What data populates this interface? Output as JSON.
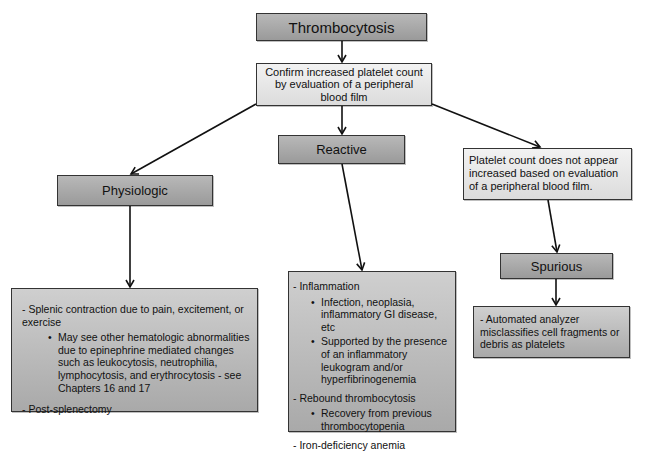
{
  "diagram": {
    "root": {
      "label": "Thrombocytosis"
    },
    "confirm": {
      "label": "Confirm increased platelet count by evaluation of a peripheral blood film"
    },
    "branches": [
      {
        "label": "Physiologic",
        "details": {
          "items": [
            {
              "text": "- Splenic contraction due to pain, excitement, or exercise",
              "sub": [
                "May see other hematologic abnormalities due to epinephrine mediated changes such as leukocytosis, neutrophilia, lymphocytosis, and erythrocytosis - see Chapters 16 and 17"
              ]
            },
            {
              "text": "- Post-splenectomy",
              "sub": []
            }
          ]
        }
      },
      {
        "label": "Reactive",
        "details": {
          "items": [
            {
              "text": "- Inflammation",
              "sub": [
                "Infection, neoplasia, inflammatory GI disease, etc",
                "Supported by the presence of an inflammatory leukogram and/or hyperfibrinogenemia"
              ]
            },
            {
              "text": "- Rebound thrombocytosis",
              "sub": [
                "Recovery from previous thrombocytopenia"
              ]
            },
            {
              "text": "- Iron-deficiency anemia",
              "sub": []
            }
          ]
        }
      },
      {
        "condition": "Platelet count does not appear increased based on evaluation of a peripheral blood film.",
        "label": "Spurious",
        "details": {
          "items": [
            {
              "text": "- Automated analyzer misclassifies cell fragments or debris as platelets",
              "sub": []
            }
          ]
        }
      }
    ]
  }
}
